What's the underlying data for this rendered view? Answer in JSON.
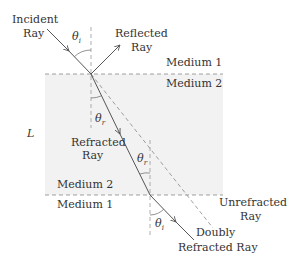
{
  "diagram": {
    "type": "optics-refraction-slab",
    "colors": {
      "slab_fill": "#f2f2f2",
      "line": "#555555",
      "dashed": "#888888",
      "text": "#333333"
    },
    "labels": {
      "incident_line1": "Incident",
      "incident_line2": "Ray",
      "reflected_line1": "Reflected",
      "reflected_line2": "Ray",
      "refracted_line1": "Refracted",
      "refracted_line2": "Ray",
      "unrefracted_line1": "Unrefracted",
      "unrefracted_line2": "Ray",
      "doubly_line1": "Doubly",
      "doubly_line2": "Refracted Ray",
      "medium1_top": "Medium 1",
      "medium2_top": "Medium 2",
      "medium2_bottom": "Medium 2",
      "medium1_bottom": "Medium 1",
      "thickness": "L"
    },
    "angles": {
      "theta_i_top": "θ",
      "theta_i_top_sub": "i",
      "theta_r_top": "θ",
      "theta_r_top_sub": "r",
      "theta_r_bottom": "θ",
      "theta_r_bottom_sub": "r",
      "theta_i_bottom": "θ",
      "theta_i_bottom_sub": "i"
    }
  }
}
